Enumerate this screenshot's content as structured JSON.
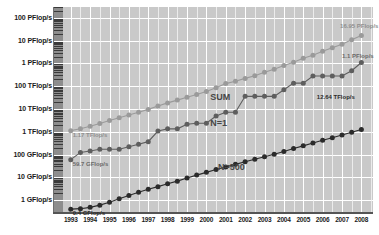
{
  "chart_data": {
    "type": "line",
    "title": "",
    "subtitle": "",
    "xlabel": "",
    "ylabel": "",
    "scale": "log",
    "grid": true,
    "legend_position": "inline-annotations",
    "x": [
      1993,
      1993.5,
      1994,
      1994.5,
      1995,
      1995.5,
      1996,
      1996.5,
      1997,
      1997.5,
      1998,
      1998.5,
      1999,
      1999.5,
      2000,
      2000.5,
      2001,
      2001.5,
      2002,
      2002.5,
      2003,
      2003.5,
      2004,
      2004.5,
      2005,
      2005.5,
      2006,
      2006.5,
      2007,
      2007.5,
      2008
    ],
    "xtick_labels": [
      "1993",
      "1994",
      "1995",
      "1996",
      "1997",
      "1998",
      "1999",
      "2000",
      "2001",
      "2002",
      "2003",
      "2004",
      "2005",
      "2006",
      "2007",
      "2008"
    ],
    "ytick_labels": [
      "1 GFlop/s",
      "10 GFlop/s",
      "100 GFlop/s",
      "1 TFlop/s",
      "10 TFlop/s",
      "100 TFlop/s",
      "1 PFlop/s",
      "10 PFlop/s",
      "100 PFlop/s"
    ],
    "ytick_values": [
      1000000000.0,
      10000000000.0,
      100000000000.0,
      1000000000000.0,
      10000000000000.0,
      100000000000000.0,
      1000000000000000.0,
      1e+16,
      1e+17
    ],
    "ylim": [
      300000000.0,
      3e+17
    ],
    "xlim": [
      1992.6,
      2008.6
    ],
    "series": [
      {
        "name": "SUM",
        "color": "#9a9a9a",
        "marker": "circle",
        "values_flops": [
          1120000000000.0,
          1350000000000.0,
          1730000000000.0,
          2300000000000.0,
          3120000000000.0,
          4100000000000.0,
          5400000000000.0,
          7200000000000.0,
          9600000000000.0,
          13500000000000.0,
          18500000000000.0,
          24500000000000.0,
          33000000000000.0,
          43500000000000.0,
          59000000000000.0,
          85000000000000.0,
          130000000000000.0,
          165000000000000.0,
          220000000000000.0,
          285000000000000.0,
          410000000000000.0,
          560000000000000.0,
          810000000000000.0,
          1130000000000000.0,
          1700000000000000.0,
          2300000000000000.0,
          3400000000000000.0,
          4900000000000000.0,
          6900000000000000.0,
          1.1e+16,
          1.695e+16
        ]
      },
      {
        "name": "N=1",
        "color": "#5e5e5e",
        "marker": "circle",
        "values_flops": [
          59700000000.0,
          124000000000.0,
          143000000000.0,
          170000000000.0,
          170000000000.0,
          170000000000.0,
          220000000000.0,
          281000000000.0,
          368000000000.0,
          1070000000000.0,
          1340000000000.0,
          1340000000000.0,
          2120000000000.0,
          2380000000000.0,
          2380000000000.0,
          4940000000000.0,
          7230000000000.0,
          7230000000000.0,
          35900000000000.0,
          35900000000000.0,
          35900000000000.0,
          35900000000000.0,
          70000000000000.0,
          136000000000000.0,
          136000000000000.0,
          280000000000000.0,
          280000000000000.0,
          280000000000000.0,
          280000000000000.0,
          478000000000000.0,
          1100000000000000.0
        ]
      },
      {
        "name": "N=500",
        "color": "#2b2b2b",
        "marker": "circle",
        "values_flops": [
          400000000.0,
          420000000.0,
          480000000.0,
          600000000.0,
          800000000.0,
          1150000000.0,
          1600000000.0,
          2200000000.0,
          3000000000.0,
          3900000000.0,
          5200000000.0,
          6800000000.0,
          9300000000.0,
          12500000000.0,
          16500000000.0,
          22000000000.0,
          28500000000.0,
          37000000000.0,
          48000000000.0,
          62000000000.0,
          80000000000.0,
          103000000000.0,
          135000000000.0,
          185000000000.0,
          240000000000.0,
          320000000000.0,
          420000000000.0,
          550000000000.0,
          720000000000.0,
          950000000000.0,
          1264000000000.0
        ]
      }
    ],
    "annotations": [
      {
        "name": "sum-series-label",
        "text": "SUM",
        "x": 2000.2,
        "y": 30000000000000.0
      },
      {
        "name": "n1-series-label",
        "text": "N=1",
        "x": 2000.2,
        "y": 2200000000000.0
      },
      {
        "name": "n500-series-label",
        "text": "N=500",
        "x": 2000.6,
        "y": 26000000000.0
      },
      {
        "name": "sum-start-value",
        "text": "1.17 TFlop/s",
        "x": 1993.1,
        "y": 550000000000.0
      },
      {
        "name": "n1-start-value",
        "text": "59.7 GFlop/s",
        "x": 1993.1,
        "y": 29000000000.0
      },
      {
        "name": "n500-start-value",
        "text": "0.4 GFlop/s",
        "x": 1993.1,
        "y": 200000000.0
      },
      {
        "name": "sum-end-value",
        "text": "16.95 PFlop/s",
        "x": 2006.9,
        "y": 3.3e+16
      },
      {
        "name": "n1-end-value",
        "text": "1.1 PFlop/s",
        "x": 2007.0,
        "y": 1550000000000000.0
      },
      {
        "name": "n500-end-value",
        "text": "12.64 TFlop/s",
        "x": 2005.7,
        "y": 26000000000000.0
      }
    ],
    "colors": {
      "plot_background": "#c9c9c9",
      "gridline": "#ffffff",
      "axis_strip": "#8d8d8d",
      "sum": "#9a9a9a",
      "n1": "#5e5e5e",
      "n500": "#2b2b2b",
      "text": "#1a1a1a"
    }
  }
}
